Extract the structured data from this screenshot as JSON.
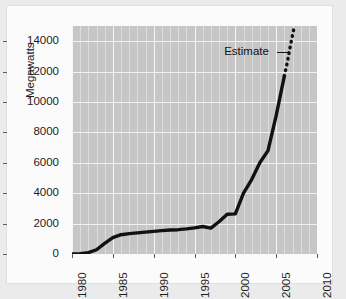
{
  "chart_data": {
    "type": "line",
    "title": "",
    "subtitle": "",
    "xlabel": "",
    "ylabel": "Megawatts",
    "xlim": [
      1980,
      2010
    ],
    "ylim": [
      0,
      15000
    ],
    "xticks": [
      1980,
      1985,
      1990,
      1995,
      2000,
      2005,
      2010
    ],
    "xtick_labels": [
      "1980",
      "1985",
      "1990",
      "1995",
      "2000",
      "2005",
      "2010"
    ],
    "yticks": [
      0,
      2000,
      4000,
      6000,
      8000,
      10000,
      12000,
      14000
    ],
    "ytick_labels": [
      "0",
      "2000",
      "4000",
      "6000",
      "8000",
      "10000",
      "12000",
      "14000"
    ],
    "grid": true,
    "grid_color": "#f2f2f2",
    "plot_background": "#c6c6c6",
    "figure_background": "#fbfbfb",
    "line_color": "#111111",
    "line_width": 3.4,
    "legend": null,
    "legend_position": "none",
    "annotations": [
      {
        "text": "Estimate",
        "x": 2005.0,
        "y": 13300,
        "points_to_x": 2006.6,
        "points_to_y": 13300,
        "leader": true
      }
    ],
    "series": [
      {
        "name": "Installed capacity",
        "style": "solid",
        "x": [
          1980,
          1981,
          1982,
          1983,
          1984,
          1985,
          1986,
          1987,
          1988,
          1989,
          1990,
          1991,
          1992,
          1993,
          1994,
          1995,
          1996,
          1997,
          1998,
          1999,
          2000,
          2001,
          2002,
          2003,
          2004,
          2005,
          2006
        ],
        "values": [
          10,
          25,
          90,
          280,
          700,
          1080,
          1270,
          1340,
          1390,
          1440,
          1490,
          1540,
          1580,
          1600,
          1650,
          1720,
          1810,
          1700,
          2120,
          2620,
          2640,
          4000,
          4900,
          6000,
          6800,
          9100,
          11700
        ]
      },
      {
        "name": "Estimate",
        "style": "dotted",
        "x": [
          2006,
          2006.2,
          2006.4,
          2006.6,
          2006.8,
          2007,
          2007.2
        ],
        "values": [
          11700,
          12200,
          12700,
          13300,
          13850,
          14400,
          14900
        ]
      }
    ]
  }
}
